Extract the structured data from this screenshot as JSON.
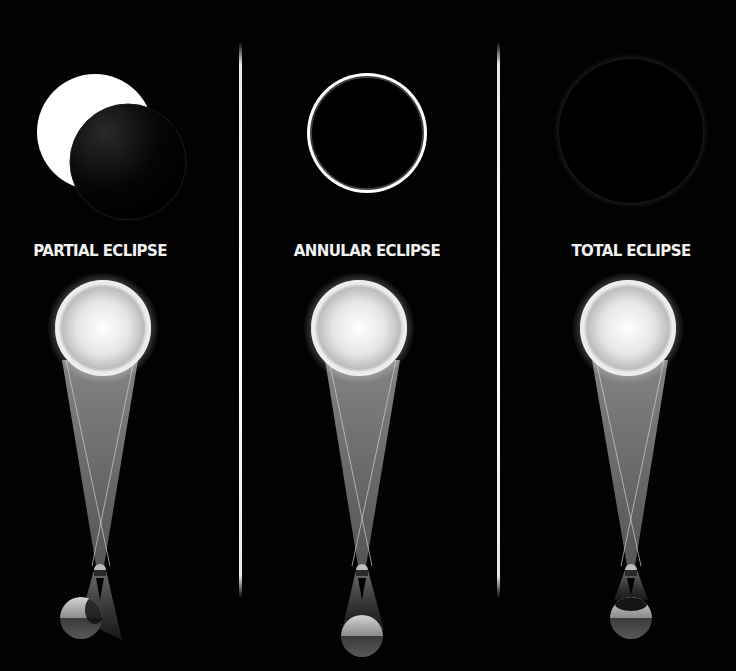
{
  "panels": [
    {
      "id": "partial",
      "label": "PARTIAL ECLIPSE",
      "label_x": 100,
      "depiction": "Sun partially covered by Moon disk, offset lower-right"
    },
    {
      "id": "annular",
      "label": "ANNULAR ECLIPSE",
      "label_x": 367,
      "depiction": "Moon centered on Sun leaving a bright thin ring"
    },
    {
      "id": "total",
      "label": "TOTAL ECLIPSE",
      "label_x": 631,
      "depiction": "Moon fully covers Sun, faint corona glow"
    }
  ],
  "colors": {
    "background": "#020202",
    "sun": "#ffffff",
    "moon": "#000000",
    "label": "#f2f2f2",
    "beam": "#8a8a8a",
    "divider": "#ffffff"
  }
}
